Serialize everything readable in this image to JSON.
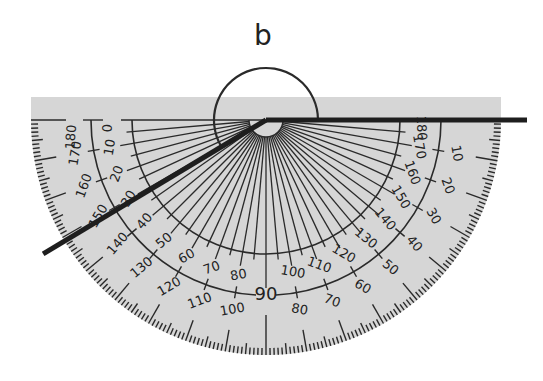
{
  "diagram": {
    "angle_label": "b",
    "colors": {
      "protractor_fill": "#d6d6d6",
      "ink": "#2a2a2a",
      "background": "#ffffff"
    },
    "geometry": {
      "center": [
        266,
        120
      ],
      "outer_radius": 235,
      "band_top": 97,
      "middle_arc_radius": 175,
      "inner_arc_radius": 134,
      "hub_radius": 17,
      "angle_arc_radius": 52
    },
    "outer_scale": {
      "labels_left_to_right_bottom": [
        "180",
        "170",
        "160",
        "150",
        "140",
        "130",
        "120",
        "110",
        "100",
        "90",
        "80",
        "70",
        "60",
        "50",
        "40",
        "30",
        "20",
        "10",
        "0"
      ],
      "visible_labels_left": [
        "180",
        "170",
        "160",
        "150",
        "140",
        "130",
        "120",
        "110",
        "100"
      ],
      "visible_labels_right": [
        "80",
        "70",
        "60",
        "50",
        "40",
        "30",
        "20",
        "10"
      ],
      "center_label": "90"
    },
    "inner_scale": {
      "labels_from_left": [
        "0",
        "10",
        "20",
        "30",
        "40",
        "50",
        "60",
        "70",
        "80"
      ],
      "labels_from_right": [
        "180",
        "170",
        "160",
        "150",
        "140",
        "130",
        "120",
        "110",
        "100"
      ]
    },
    "arms": [
      {
        "name": "right-arm",
        "angle_deg": 0,
        "length": 261
      },
      {
        "name": "left-arm",
        "angle_deg": 211,
        "length": 260
      }
    ],
    "reflex_angle_start_deg": 0,
    "reflex_angle_end_deg": 211
  }
}
